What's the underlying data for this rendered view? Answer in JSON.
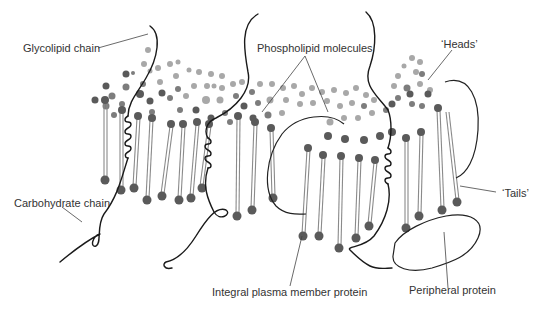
{
  "diagram": {
    "colors": {
      "head_dark": "#5a5a5a",
      "head_mid": "#7d7d7d",
      "head_light": "#a8a8a8",
      "tail": "#8a8a8a",
      "outline": "#1a1a1a",
      "label_text": "#333333"
    },
    "labels": {
      "glycolipid_chain": "Glycolipid chain",
      "phospholipid_molecules": "Phospholipid molecules",
      "heads": "‘Heads’",
      "tails": "‘Tails’",
      "carbohydrate_chain": "Carbohydrate chain",
      "integral_protein": "Integral plasma member protein",
      "peripheral_protein": "Peripheral protein"
    }
  }
}
